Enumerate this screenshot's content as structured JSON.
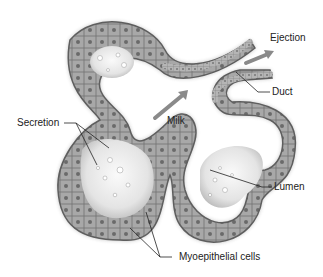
{
  "diagram": {
    "labels": {
      "ejection": "Ejection",
      "duct": "Duct",
      "secretion": "Secretion",
      "milk": "Milk",
      "lumen": "Lumen",
      "myoepithelial": "Myoepithelial cells"
    },
    "colors": {
      "background": "#ffffff",
      "tissue_dark": "#6e6e6e",
      "tissue_mid": "#9a9a9a",
      "tissue_light": "#d6d6d6",
      "lumen": "#f2f2f2",
      "arrow": "#8a8a8a",
      "leader_line": "#222222",
      "text": "#222222"
    }
  }
}
